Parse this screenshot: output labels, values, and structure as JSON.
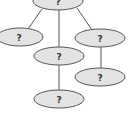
{
  "diagram": {
    "type": "tree",
    "colors": {
      "node_fill": "#e3e3e3",
      "node_stroke": "#555555",
      "edge": "#555555",
      "text": "#333333"
    },
    "nodes": [
      {
        "id": "root",
        "label": "?",
        "cx": 58,
        "cy": 1,
        "rx": 25,
        "ry": 9
      },
      {
        "id": "left",
        "label": "?",
        "cx": 20,
        "cy": 37,
        "rx": 23,
        "ry": 9
      },
      {
        "id": "middle",
        "label": "?",
        "cx": 59,
        "cy": 56,
        "rx": 25,
        "ry": 9
      },
      {
        "id": "right",
        "label": "?",
        "cx": 100,
        "cy": 38,
        "rx": 25,
        "ry": 9
      },
      {
        "id": "right-child",
        "label": "?",
        "cx": 100,
        "cy": 77,
        "rx": 25,
        "ry": 9
      },
      {
        "id": "bottom",
        "label": "?",
        "cx": 59,
        "cy": 99,
        "rx": 25,
        "ry": 9
      }
    ],
    "edges": [
      {
        "from": "root",
        "to": "left"
      },
      {
        "from": "root",
        "to": "middle"
      },
      {
        "from": "root",
        "to": "right"
      },
      {
        "from": "middle",
        "to": "bottom"
      },
      {
        "from": "right",
        "to": "right-child"
      }
    ]
  }
}
